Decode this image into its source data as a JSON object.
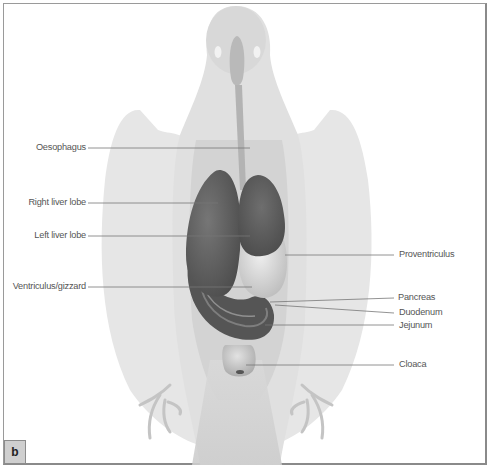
{
  "figure": {
    "panel_label": "b",
    "colors": {
      "silhouette_light": "#e4e4e4",
      "silhouette_mid": "#d6d6d6",
      "organ_dark": "#5e5e5e",
      "organ_light": "#d8d8d8",
      "leader_line": "#777777",
      "label_text": "#555555",
      "frame": "#9a9a9a"
    }
  },
  "labels": {
    "left": [
      {
        "text": "Oesophagus"
      },
      {
        "text": "Right liver lobe"
      },
      {
        "text": "Left liver lobe"
      },
      {
        "text": "Ventriculus/gizzard"
      }
    ],
    "right": [
      {
        "text": "Proventriculus"
      },
      {
        "text": "Pancreas"
      },
      {
        "text": "Duodenum"
      },
      {
        "text": "Jejunum"
      },
      {
        "text": "Cloaca"
      }
    ]
  }
}
